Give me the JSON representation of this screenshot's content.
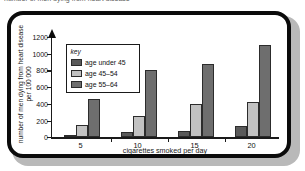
{
  "top_caption": "number of men dying from heart disease",
  "chart_data": {
    "type": "bar",
    "title": "",
    "xlabel": "cigarettes smoked per day",
    "ylabel": "number of men dying from heart disease per 100 000",
    "categories": [
      "5",
      "10",
      "15",
      "20"
    ],
    "series": [
      {
        "name": "age under 45",
        "values": [
          30,
          60,
          70,
          130
        ],
        "color": "#5a5a5a"
      },
      {
        "name": "age 45–54",
        "values": [
          150,
          250,
          400,
          420
        ],
        "color": "#c2c2c2"
      },
      {
        "name": "age 55–64",
        "values": [
          460,
          800,
          880,
          1100
        ],
        "color": "#6e6e6e"
      }
    ],
    "ylim": [
      0,
      1200
    ],
    "yticks": [
      "0",
      "200",
      "400",
      "600",
      "800",
      "1000",
      "1200"
    ],
    "ytick_values": [
      0,
      200,
      400,
      600,
      800,
      1000,
      1200
    ],
    "grid": false,
    "legend_position": "upper-left-inside",
    "legend_title": "key"
  },
  "frame": {
    "border_color": "#0b0b0b",
    "shadow_color": "#b9b9b9",
    "background": "#ffffff"
  }
}
